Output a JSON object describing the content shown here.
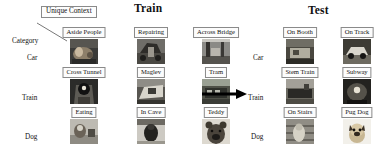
{
  "figure": {
    "sections": {
      "train": {
        "title": "Train"
      },
      "test": {
        "title": "Test"
      }
    },
    "annotations": {
      "unique_context": "Unique Context",
      "category": "Category"
    },
    "arrow": {
      "name": "right-arrow",
      "direction": "right"
    }
  },
  "train": {
    "row_labels": [
      "Car",
      "Train",
      "Dog"
    ],
    "rows": [
      {
        "category": "Car",
        "cells": [
          {
            "label": "Aside People",
            "image": "car-aside-people-photo"
          },
          {
            "label": "Repairing",
            "image": "car-repairing-photo"
          },
          {
            "label": "Across Bridge",
            "image": "car-across-bridge-photo"
          }
        ]
      },
      {
        "category": "Train",
        "cells": [
          {
            "label": "Cross Tunnel",
            "image": "train-cross-tunnel-photo"
          },
          {
            "label": "Maglev",
            "image": "train-maglev-photo"
          },
          {
            "label": "Tram",
            "image": "train-tram-photo"
          }
        ]
      },
      {
        "category": "Dog",
        "cells": [
          {
            "label": "Eating",
            "image": "dog-eating-photo"
          },
          {
            "label": "In Cave",
            "image": "dog-in-cave-photo"
          },
          {
            "label": "Teddy",
            "image": "dog-teddy-photo"
          }
        ]
      }
    ]
  },
  "test": {
    "row_labels": [
      "Car",
      "Train",
      "Dog"
    ],
    "rows": [
      {
        "category": "Car",
        "cells": [
          {
            "label": "On Booth",
            "image": "car-on-booth-photo"
          },
          {
            "label": "On Track",
            "image": "car-on-track-photo"
          }
        ]
      },
      {
        "category": "Train",
        "cells": [
          {
            "label": "Stem Train",
            "image": "train-stem-train-photo"
          },
          {
            "label": "Subway",
            "image": "train-subway-photo"
          }
        ]
      },
      {
        "category": "Dog",
        "cells": [
          {
            "label": "On Stairs",
            "image": "dog-on-stairs-photo"
          },
          {
            "label": "Pug Dog",
            "image": "dog-pug-dog-photo"
          }
        ]
      }
    ]
  },
  "colors": {
    "box_border": "#8a8a8a",
    "text": "#111111",
    "arrow": "#000000",
    "background": "#ffffff"
  }
}
